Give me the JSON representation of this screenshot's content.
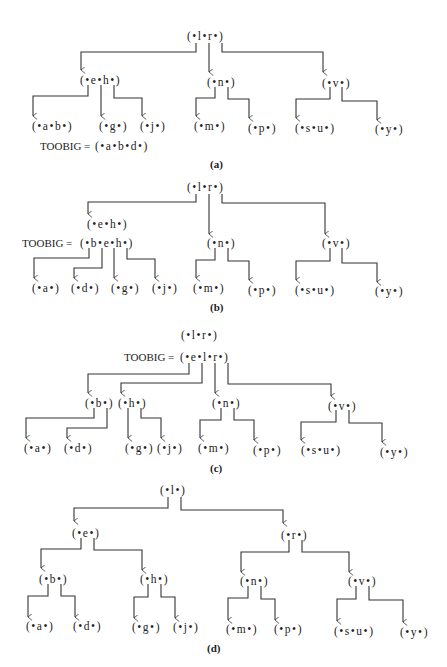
{
  "figure": {
    "panels": [
      {
        "id": "a",
        "caption": "(a)",
        "nodes": [
          {
            "id": "a_root",
            "label": "(•l•r•)",
            "x": 212,
            "y": 42
          },
          {
            "id": "a_eh",
            "label": "(•e•h•)",
            "x": 100,
            "y": 85
          },
          {
            "id": "a_n",
            "label": "(•n•)",
            "x": 222,
            "y": 87
          },
          {
            "id": "a_v",
            "label": "(•v•)",
            "x": 340,
            "y": 87
          },
          {
            "id": "a_ab",
            "label": "(•a•b•)",
            "x": 53,
            "y": 130
          },
          {
            "id": "a_g",
            "label": "(•g•)",
            "x": 115,
            "y": 130
          },
          {
            "id": "a_j",
            "label": "(•j•)",
            "x": 155,
            "y": 130
          },
          {
            "id": "a_m",
            "label": "(•m•)",
            "x": 213,
            "y": 130
          },
          {
            "id": "a_p",
            "label": "(•p•)",
            "x": 263,
            "y": 132
          },
          {
            "id": "a_su",
            "label": "(•s•u•)",
            "x": 315,
            "y": 132
          },
          {
            "id": "a_y",
            "label": "(•y•)",
            "x": 388,
            "y": 133
          }
        ],
        "toobig": {
          "label": "TOOBIG = ",
          "value": "(•a•b•d•)",
          "x": 40,
          "y": 150
        }
      },
      {
        "id": "b",
        "caption": "(b)",
        "nodes": [
          {
            "id": "b_root",
            "label": "(•l•r•)",
            "x": 212,
            "y": 190
          },
          {
            "id": "b_eh",
            "label": "(•e•h•)",
            "x": 108,
            "y": 228
          },
          {
            "id": "b_n",
            "label": "(•n•)",
            "x": 222,
            "y": 247
          },
          {
            "id": "b_v",
            "label": "(•v•)",
            "x": 340,
            "y": 247
          },
          {
            "id": "b_a",
            "label": "(•a•)",
            "x": 48,
            "y": 292
          },
          {
            "id": "b_d",
            "label": "(•d•)",
            "x": 87,
            "y": 292
          },
          {
            "id": "b_g",
            "label": "(•g•)",
            "x": 127,
            "y": 292
          },
          {
            "id": "b_j",
            "label": "(•j•)",
            "x": 168,
            "y": 292
          },
          {
            "id": "b_m",
            "label": "(•m•)",
            "x": 208,
            "y": 292
          },
          {
            "id": "b_p",
            "label": "(•p•)",
            "x": 263,
            "y": 294
          },
          {
            "id": "b_su",
            "label": "(•s•u•)",
            "x": 315,
            "y": 294
          },
          {
            "id": "b_y",
            "label": "(•y•)",
            "x": 390,
            "y": 295
          }
        ],
        "toobig": {
          "label": "TOOBIG = ",
          "value": "(•b•e•h•)",
          "x": 22,
          "y": 247
        }
      },
      {
        "id": "c",
        "caption": "(c)",
        "nodes": [
          {
            "id": "c_root",
            "label": "(•l•r•)",
            "x": 202,
            "y": 341
          },
          {
            "id": "c_b",
            "label": "(•b•)",
            "x": 100,
            "y": 407
          },
          {
            "id": "c_h",
            "label": "(•h•)",
            "x": 132,
            "y": 407
          },
          {
            "id": "c_n",
            "label": "(•n•)",
            "x": 227,
            "y": 407
          },
          {
            "id": "c_v",
            "label": "(•v•)",
            "x": 346,
            "y": 410
          },
          {
            "id": "c_a",
            "label": "(•a•)",
            "x": 36,
            "y": 452
          },
          {
            "id": "c_d",
            "label": "(•d•)",
            "x": 76,
            "y": 452
          },
          {
            "id": "c_g",
            "label": "(•g•)",
            "x": 137,
            "y": 452
          },
          {
            "id": "c_j",
            "label": "(•j•)",
            "x": 170,
            "y": 452
          },
          {
            "id": "c_m",
            "label": "(•m•)",
            "x": 211,
            "y": 452
          },
          {
            "id": "c_p",
            "label": "(•p•)",
            "x": 268,
            "y": 454
          },
          {
            "id": "c_su",
            "label": "(•s•u•)",
            "x": 322,
            "y": 454
          },
          {
            "id": "c_y",
            "label": "(•y•)",
            "x": 395,
            "y": 456
          }
        ],
        "toobig": {
          "label": "TOOBIG = ",
          "value": "(•e•l•r•)",
          "x": 124,
          "y": 362
        }
      },
      {
        "id": "d",
        "caption": "(d)",
        "nodes": [
          {
            "id": "d_root",
            "label": "(•l•)",
            "x": 175,
            "y": 496
          },
          {
            "id": "d_e",
            "label": "(•e•)",
            "x": 88,
            "y": 537
          },
          {
            "id": "d_r",
            "label": "(•r•)",
            "x": 300,
            "y": 539
          },
          {
            "id": "d_b",
            "label": "(•b•)",
            "x": 55,
            "y": 583
          },
          {
            "id": "d_h",
            "label": "(•h•)",
            "x": 155,
            "y": 583
          },
          {
            "id": "d_n",
            "label": "(•n•)",
            "x": 257,
            "y": 585
          },
          {
            "id": "d_v",
            "label": "(•v•)",
            "x": 365,
            "y": 585
          },
          {
            "id": "d_a",
            "label": "(•a•)",
            "x": 36,
            "y": 630
          },
          {
            "id": "d_d",
            "label": "(•d•)",
            "x": 83,
            "y": 630
          },
          {
            "id": "d_g",
            "label": "(•g•)",
            "x": 144,
            "y": 631
          },
          {
            "id": "d_j",
            "label": "(•j•)",
            "x": 186,
            "y": 631
          },
          {
            "id": "d_m",
            "label": "(•m•)",
            "x": 238,
            "y": 633
          },
          {
            "id": "d_p",
            "label": "(•p•)",
            "x": 285,
            "y": 633
          },
          {
            "id": "d_su",
            "label": "(•s•u•)",
            "x": 347,
            "y": 635
          },
          {
            "id": "d_y",
            "label": "(•y•)",
            "x": 413,
            "y": 636
          }
        ],
        "toobig": null
      }
    ]
  }
}
